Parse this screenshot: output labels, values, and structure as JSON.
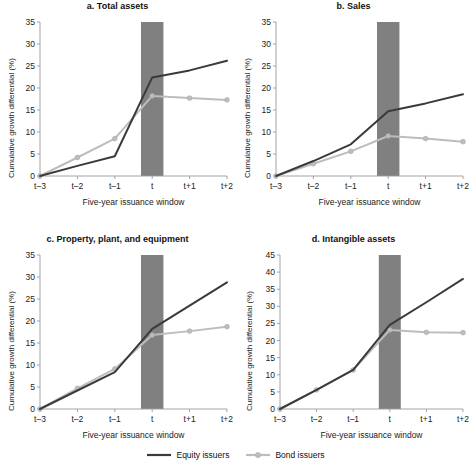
{
  "figure": {
    "legend": {
      "equity_label": "Equity issuers",
      "bond_label": "Bond issuers",
      "equity_color": "#3a3a3a",
      "bond_color": "#bdbdbd"
    },
    "band_color": "#808080",
    "axis_color": "#9a9a9a"
  },
  "chart_data": [
    {
      "id": "a",
      "type": "line",
      "title": "a. Total assets",
      "xlabel": "Five-year issuance window",
      "ylabel": "Cumulative growth differential (%)",
      "categories": [
        "t–3",
        "t–2",
        "t–1",
        "t",
        "t+1",
        "t+2"
      ],
      "ylim": [
        0,
        35
      ],
      "yticks": [
        0,
        5,
        10,
        15,
        20,
        25,
        30,
        35
      ],
      "grid": false,
      "legend_position": "figure-bottom",
      "shaded_band": {
        "center_category": "t",
        "label": "issuance year",
        "from": 0,
        "to": 35
      },
      "series": [
        {
          "name": "Equity issuers",
          "color": "#3a3a3a",
          "markers": false,
          "values": [
            0.0,
            2.3,
            4.5,
            22.4,
            24.0,
            26.2
          ]
        },
        {
          "name": "Bond issuers",
          "color": "#bdbdbd",
          "markers": true,
          "values": [
            0.0,
            4.2,
            8.5,
            18.2,
            17.7,
            17.3
          ]
        }
      ]
    },
    {
      "id": "b",
      "type": "line",
      "title": "b. Sales",
      "xlabel": "Five-year issuance window",
      "ylabel": "Cumulative growth differential (%)",
      "categories": [
        "t–3",
        "t–2",
        "t–1",
        "t",
        "t+1",
        "t+2"
      ],
      "ylim": [
        0,
        35
      ],
      "yticks": [
        0,
        5,
        10,
        15,
        20,
        25,
        30,
        35
      ],
      "grid": false,
      "legend_position": "figure-bottom",
      "shaded_band": {
        "center_category": "t",
        "label": "issuance year",
        "from": 0,
        "to": 35
      },
      "series": [
        {
          "name": "Equity issuers",
          "color": "#3a3a3a",
          "markers": false,
          "values": [
            0.0,
            3.4,
            7.2,
            14.7,
            16.5,
            18.6
          ]
        },
        {
          "name": "Bond issuers",
          "color": "#bdbdbd",
          "markers": true,
          "values": [
            0.0,
            2.8,
            5.6,
            9.1,
            8.5,
            7.8
          ]
        }
      ]
    },
    {
      "id": "c",
      "type": "line",
      "title": "c. Property, plant, and equipment",
      "xlabel": "Five-year issuance window",
      "ylabel": "Cumulative growth differential (%)",
      "categories": [
        "t–3",
        "t–2",
        "t–1",
        "t",
        "t+1",
        "t+2"
      ],
      "ylim": [
        0,
        35
      ],
      "yticks": [
        0,
        5,
        10,
        15,
        20,
        25,
        30,
        35
      ],
      "grid": false,
      "legend_position": "figure-bottom",
      "shaded_band": {
        "center_category": "t",
        "label": "issuance year",
        "from": 0,
        "to": 35
      },
      "series": [
        {
          "name": "Equity issuers",
          "color": "#3a3a3a",
          "markers": false,
          "values": [
            0.0,
            4.2,
            8.4,
            18.2,
            23.5,
            28.8
          ]
        },
        {
          "name": "Bond issuers",
          "color": "#bdbdbd",
          "markers": true,
          "values": [
            0.0,
            4.7,
            9.1,
            16.8,
            17.7,
            18.7
          ]
        }
      ]
    },
    {
      "id": "d",
      "type": "line",
      "title": "d. Intangible assets",
      "xlabel": "Five-year issuance window",
      "ylabel": "Cumulative growth differential (%)",
      "categories": [
        "t–3",
        "t–2",
        "t–1",
        "t",
        "t+1",
        "t+2"
      ],
      "ylim": [
        0,
        45
      ],
      "yticks": [
        0,
        5,
        10,
        15,
        20,
        25,
        30,
        35,
        40,
        45
      ],
      "grid": false,
      "legend_position": "figure-bottom",
      "shaded_band": {
        "center_category": "t",
        "label": "issuance year",
        "from": 0,
        "to": 45
      },
      "series": [
        {
          "name": "Equity issuers",
          "color": "#3a3a3a",
          "markers": false,
          "values": [
            0.0,
            5.6,
            11.4,
            24.6,
            31.2,
            38.0
          ]
        },
        {
          "name": "Bond issuers",
          "color": "#bdbdbd",
          "markers": true,
          "values": [
            0.0,
            5.6,
            11.4,
            23.1,
            22.4,
            22.3
          ]
        }
      ]
    }
  ]
}
